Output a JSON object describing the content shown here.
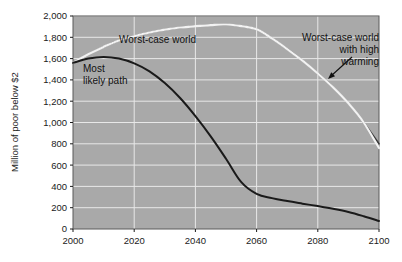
{
  "chart_data": {
    "type": "line",
    "title": "",
    "subtitle": "",
    "xlabel": "",
    "ylabel": "Million of poor below $2",
    "xlim": [
      2000,
      2100
    ],
    "ylim": [
      0,
      2000
    ],
    "xticks": [
      "2000",
      "2020",
      "2040",
      "2060",
      "2080",
      "2100"
    ],
    "yticks": [
      "0",
      "200",
      "400",
      "600",
      "800",
      "1,000",
      "1,200",
      "1,400",
      "1,600",
      "1,800",
      "2,000"
    ],
    "grid": true,
    "legend_position": "inline-annotations",
    "plot_background_color": "#a9a9a9",
    "gridline_color": "#e8e8e8",
    "x": [
      2000,
      2005,
      2010,
      2015,
      2020,
      2025,
      2030,
      2035,
      2040,
      2045,
      2050,
      2055,
      2060,
      2065,
      2070,
      2075,
      2080,
      2085,
      2090,
      2095,
      2100
    ],
    "series": [
      {
        "name": "Worst-case world",
        "color": "#3a3a3a",
        "values": [
          1560,
          1640,
          1710,
          1770,
          1810,
          1845,
          1872,
          1892,
          1905,
          1915,
          1920,
          1905,
          1875,
          1790,
          1690,
          1580,
          1460,
          1330,
          1180,
          1000,
          800
        ]
      },
      {
        "name": "Worst-case world with high warming",
        "color": "#f2f2f2",
        "values": [
          1560,
          1640,
          1710,
          1770,
          1810,
          1845,
          1872,
          1892,
          1905,
          1915,
          1920,
          1905,
          1875,
          1790,
          1690,
          1580,
          1460,
          1330,
          1180,
          1000,
          760
        ]
      },
      {
        "name": "Most likely path",
        "color": "#1a1a1a",
        "values": [
          1560,
          1600,
          1615,
          1600,
          1555,
          1480,
          1370,
          1230,
          1060,
          870,
          660,
          440,
          330,
          290,
          262,
          238,
          215,
          190,
          160,
          120,
          75
        ]
      }
    ],
    "annotations": [
      {
        "id": "worst-case-world",
        "lines": [
          "Worst-case world"
        ],
        "align": "start",
        "x_px": 119,
        "y_px": 43
      },
      {
        "id": "most-likely-path",
        "lines": [
          "Most",
          "likely path"
        ],
        "align": "start",
        "x_px": 83,
        "y_px": 72
      },
      {
        "id": "worst-case-high-warming",
        "lines": [
          "Worst-case world",
          "with high",
          "warming"
        ],
        "align": "end",
        "x_px": 379,
        "y_px": 41,
        "arrow": {
          "from_x_px": 352,
          "from_y_px": 57,
          "to_x_px": 328,
          "to_y_px": 79
        }
      }
    ]
  }
}
